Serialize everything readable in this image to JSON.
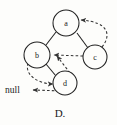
{
  "figure": {
    "caption": "D.",
    "null_label": "null",
    "colors": {
      "background": "#fdfdfb",
      "stroke": "#222222",
      "dashed_stroke": "#333333",
      "text": "#1a1a1a"
    }
  },
  "diagram": {
    "type": "threaded-binary-tree",
    "nodes": [
      {
        "id": "a",
        "label": "a",
        "cx": 66,
        "cy": 23,
        "r": 13
      },
      {
        "id": "b",
        "label": "b",
        "cx": 37,
        "cy": 55,
        "r": 13
      },
      {
        "id": "c",
        "label": "c",
        "cx": 95,
        "cy": 57,
        "r": 12
      },
      {
        "id": "d",
        "label": "d",
        "cx": 65,
        "cy": 83,
        "r": 12
      }
    ],
    "solid_edges": [
      {
        "name": "edge-a-b",
        "from": "a",
        "to": "b"
      },
      {
        "name": "edge-a-c",
        "from": "a",
        "to": "c"
      },
      {
        "name": "edge-b-d",
        "from": "b",
        "to": "d"
      }
    ],
    "dashed_edges": [
      {
        "name": "thread-c-a",
        "from": "c",
        "to": "a",
        "style": "curved-right"
      },
      {
        "name": "thread-c-b",
        "from": "c",
        "to": "b",
        "style": "straight"
      },
      {
        "name": "thread-d-b",
        "from": "d",
        "to": "b",
        "style": "straight"
      },
      {
        "name": "thread-b-d",
        "from": "b",
        "to": "d",
        "style": "curved-left"
      },
      {
        "name": "thread-d-null",
        "from": "d",
        "to": "null",
        "style": "straight"
      }
    ]
  }
}
